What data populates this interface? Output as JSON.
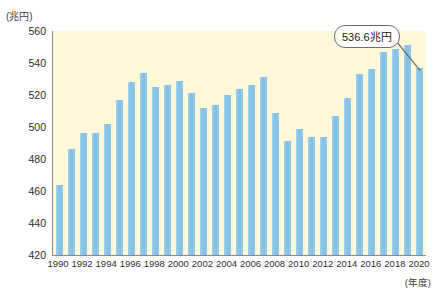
{
  "chart_data": {
    "type": "bar",
    "title": "",
    "subtitle": "",
    "xlabel": "(年度)",
    "ylabel": "(兆円)",
    "ylim": [
      420,
      560
    ],
    "ytick_values": [
      420,
      440,
      460,
      480,
      500,
      520,
      540,
      560
    ],
    "ytick_labels": [
      "420",
      "440",
      "460",
      "480",
      "500",
      "520",
      "540",
      "560"
    ],
    "grid": false,
    "legend": null,
    "categories": [
      "1990",
      "1991",
      "1992",
      "1993",
      "1994",
      "1995",
      "1996",
      "1997",
      "1998",
      "1999",
      "2000",
      "2001",
      "2002",
      "2003",
      "2004",
      "2005",
      "2006",
      "2007",
      "2008",
      "2009",
      "2010",
      "2011",
      "2012",
      "2013",
      "2014",
      "2015",
      "2016",
      "2017",
      "2018",
      "2019",
      "2020"
    ],
    "xtick_labels": [
      "1990",
      "1992",
      "1994",
      "1996",
      "1998",
      "2000",
      "2002",
      "2004",
      "2006",
      "2008",
      "2010",
      "2012",
      "2014",
      "2016",
      "2018",
      "2020"
    ],
    "values": [
      464.0,
      486.0,
      496.0,
      496.0,
      502.0,
      517.0,
      528.0,
      534.0,
      525.0,
      526.0,
      529.0,
      521.0,
      512.0,
      514.0,
      520.0,
      524.0,
      526.0,
      531.0,
      509.0,
      491.0,
      499.0,
      494.0,
      494.0,
      507.0,
      518.0,
      533.0,
      536.0,
      547.0,
      549.0,
      551.0,
      536.6
    ],
    "annotations": [
      {
        "label": "536.6兆円",
        "target_category": "2020",
        "target_value": 536.6
      }
    ],
    "colors": {
      "bar": "#8ec6e6",
      "plot_background": "#fbf8dc",
      "axis": "#8a8a8a",
      "text": "#2e2e2e",
      "callout_border": "#6e6e6e",
      "callout_background": "#ffffff",
      "page_background": "#ffffff"
    }
  }
}
